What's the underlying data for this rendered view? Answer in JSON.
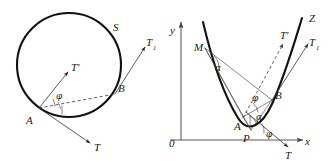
{
  "figure": {
    "caption": "",
    "background_color": "#ffffff",
    "ink_color": "#111111",
    "panels": [
      {
        "id": "left-panel",
        "kind": "circle-diagram",
        "shape": {
          "name": "circle",
          "center_x": 69,
          "center_y": 65,
          "radius": 52
        },
        "labels": {
          "curve": "S",
          "point_a": "A",
          "point_b": "B",
          "vector_t": "T",
          "vector_t_prime": "T'",
          "vector_t1": "T",
          "vector_t1_sub": "1",
          "angle_phi": "φ"
        }
      },
      {
        "id": "right-panel",
        "kind": "parabola-diagram",
        "axes": {
          "x_label": "x",
          "y_label": "y",
          "origin_label": "0"
        },
        "labels": {
          "curve": "Z",
          "point_m": "M",
          "point_a": "A",
          "point_b": "B",
          "point_p": "P",
          "vector_t": "T",
          "vector_t_prime": "T'",
          "vector_t1": "T",
          "vector_t1_sub": "1",
          "angle_alpha_upper": "α",
          "angle_alpha_lower": "α",
          "angle_phi_upper": "φ",
          "angle_phi_lower": "φ"
        }
      }
    ]
  }
}
